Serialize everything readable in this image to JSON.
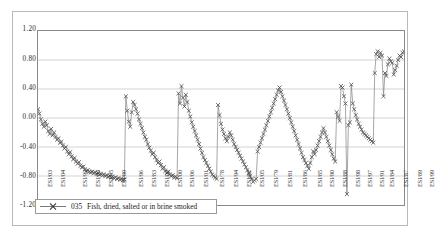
{
  "chart_data": {
    "type": "line",
    "title": "",
    "subtitle": "",
    "xlabel": "",
    "ylabel": "",
    "ylim": [
      -1.2,
      1.2
    ],
    "grid": true,
    "gridlines_horizontal": [
      1.2,
      0.8,
      0.4,
      0.0,
      -0.4,
      -0.8,
      -1.2
    ],
    "legend_position": "bottom-left-inside",
    "marker": "x",
    "line_color": "#808080",
    "marker_color": "#555555",
    "ytick_labels": [
      "1.20",
      "0.80",
      "0.40",
      "0.00",
      "-0.40",
      "-0.80",
      "-1.20"
    ],
    "ytick_values": [
      1.2,
      0.8,
      0.4,
      0.0,
      -0.4,
      -0.8,
      -1.2
    ],
    "xtick_labels": [
      "ESI/03",
      "ESI/04",
      "ESI/92",
      "ESI/93",
      "ESI/95",
      "ESI/80",
      "ESI/96",
      "ESI/83",
      "ESI/02",
      "ESI/00",
      "ESI/06",
      "ESI/01",
      "ESI/78",
      "ESI/94",
      "ESI/82",
      "ESI/05",
      "ESI/79",
      "ESI/81",
      "ESI/86",
      "ESI/85",
      "ESI/90",
      "ESI/88",
      "ESI/98",
      "ESI/97",
      "ESI/91",
      "ESI/84",
      "ESI/87",
      "ESI/89",
      "ESI/99"
    ],
    "xtick_positions": [
      10,
      23,
      45,
      58,
      71,
      84,
      101,
      114,
      127,
      140,
      152,
      166,
      182,
      196,
      209,
      222,
      236,
      250,
      265,
      280,
      292,
      305,
      318,
      330,
      342,
      352,
      366,
      380,
      392
    ],
    "series": [
      {
        "name": "035  Fish, dried, salted or in brine  smoked",
        "code": "035",
        "label": "Fish, dried, salted or in brine  smoked",
        "values": [
          0.12,
          0.06,
          -0.02,
          -0.08,
          -0.12,
          -0.05,
          -0.1,
          -0.18,
          -0.22,
          -0.15,
          -0.24,
          -0.2,
          -0.26,
          -0.3,
          -0.28,
          -0.34,
          -0.33,
          -0.38,
          -0.42,
          -0.4,
          -0.46,
          -0.5,
          -0.47,
          -0.53,
          -0.57,
          -0.55,
          -0.6,
          -0.63,
          -0.61,
          -0.66,
          -0.68,
          -0.67,
          -0.71,
          -0.73,
          -0.72,
          -0.74,
          -0.75,
          -0.74,
          -0.76,
          -0.75,
          -0.77,
          -0.76,
          -0.78,
          -0.77,
          -0.79,
          -0.78,
          -0.8,
          -0.79,
          -0.81,
          -0.8,
          -0.82,
          -0.81,
          -0.83,
          -0.82,
          -0.84,
          -0.83,
          -0.85,
          -0.84,
          -0.86,
          -0.85,
          0.3,
          0.1,
          -0.05,
          -0.12,
          0.08,
          0.22,
          0.18,
          0.12,
          0.06,
          -0.02,
          -0.08,
          -0.14,
          -0.2,
          -0.26,
          -0.3,
          -0.36,
          -0.41,
          -0.45,
          -0.5,
          -0.48,
          -0.54,
          -0.58,
          -0.62,
          -0.6,
          -0.65,
          -0.7,
          -0.68,
          -0.73,
          -0.76,
          -0.74,
          -0.78,
          -0.8,
          -0.79,
          -0.82,
          -0.81,
          -0.83,
          0.34,
          0.2,
          0.44,
          0.28,
          0.16,
          0.32,
          0.22,
          0.1,
          0.02,
          -0.06,
          -0.12,
          -0.18,
          -0.24,
          -0.3,
          -0.36,
          -0.42,
          -0.48,
          -0.54,
          -0.58,
          -0.62,
          -0.66,
          -0.7,
          -0.74,
          -0.78,
          -0.8,
          -0.82,
          -0.84,
          0.18,
          0.04,
          -0.08,
          -0.16,
          -0.22,
          -0.28,
          -0.32,
          -0.26,
          -0.2,
          -0.24,
          -0.3,
          -0.36,
          -0.4,
          -0.44,
          -0.48,
          -0.52,
          -0.56,
          -0.6,
          -0.64,
          -0.68,
          -0.72,
          -0.76,
          -0.8,
          -0.84,
          -0.88,
          -0.86,
          -0.84,
          -0.46,
          -0.4,
          -0.34,
          -0.28,
          -0.22,
          -0.16,
          -0.1,
          -0.04,
          0.02,
          0.08,
          0.14,
          0.2,
          0.26,
          0.32,
          0.38,
          0.42,
          0.36,
          0.3,
          0.24,
          0.18,
          0.12,
          0.06,
          0.0,
          -0.06,
          -0.12,
          -0.18,
          -0.24,
          -0.3,
          -0.36,
          -0.42,
          -0.48,
          -0.54,
          -0.58,
          -0.62,
          -0.66,
          -0.7,
          -0.62,
          -0.54,
          -0.46,
          -0.5,
          -0.44,
          -0.38,
          -0.32,
          -0.26,
          -0.2,
          -0.14,
          -0.2,
          -0.26,
          -0.32,
          -0.38,
          -0.44,
          -0.5,
          -0.56,
          -0.6,
          0.08,
          0.02,
          -0.04,
          0.44,
          0.42,
          0.3,
          0.2,
          -1.05,
          -0.1,
          -0.06,
          0.46,
          0.2,
          0.12,
          0.04,
          -0.02,
          -0.08,
          -0.12,
          -0.16,
          -0.2,
          -0.22,
          -0.24,
          -0.26,
          -0.28,
          -0.3,
          -0.32,
          -0.34,
          0.62,
          0.88,
          0.92,
          0.84,
          0.9,
          0.86,
          0.3,
          0.62,
          0.58,
          0.74,
          0.82,
          0.78,
          0.76,
          0.6,
          0.66,
          0.72,
          0.8,
          0.86,
          0.84,
          0.9,
          0.92
        ]
      }
    ]
  },
  "legend": {
    "code": "035",
    "label": "Fish, dried, salted or in brine  smoked",
    "marker_icon": "x-marker-line-icon"
  }
}
